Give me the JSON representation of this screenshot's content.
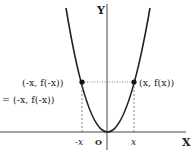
{
  "diagram": {
    "type": "even-function-graph",
    "axes": {
      "x_label": "X",
      "y_label": "Y",
      "origin_label": "O"
    },
    "ticks": {
      "neg_x": "-x",
      "pos_x": "x"
    },
    "points": {
      "left_label_1": "(-x, f(-x))",
      "left_label_2": "= (-x, f(-x))",
      "right_label": "(x, f(x))"
    },
    "colors": {
      "curve": "#222222",
      "axis": "#333333",
      "guide": "#555555"
    }
  }
}
